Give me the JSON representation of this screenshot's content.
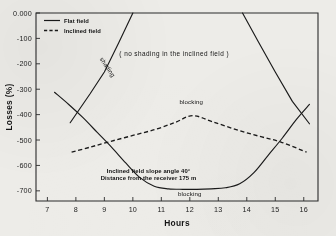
{
  "figure": {
    "background_color": "#edece8",
    "ink_color": "#1a1a1a"
  },
  "chart_data": {
    "type": "line",
    "title": "",
    "xlabel": "Hours",
    "ylabel": "Losses (%)",
    "xlim": [
      6.6,
      16.5
    ],
    "ylim": [
      -740,
      0
    ],
    "grid": false,
    "legend_position": "top-left",
    "xticks": [
      "7",
      "8",
      "9",
      "10",
      "11",
      "12",
      "13",
      "14",
      "15",
      "16"
    ],
    "xtick_values": [
      7,
      8,
      9,
      10,
      11,
      12,
      13,
      14,
      15,
      16
    ],
    "yticks": [
      "-700",
      "-600",
      "-500",
      "-400",
      "-300",
      "-200",
      "-100",
      "0.000"
    ],
    "ytick_values": [
      -700,
      -600,
      -500,
      -400,
      -300,
      -200,
      -100,
      0
    ],
    "series": [
      {
        "name": "Flat field",
        "style": "solid",
        "label": "blocking",
        "x": [
          7.25,
          7.75,
          8.25,
          8.75,
          9.25,
          9.75,
          10.25,
          10.75,
          11.25,
          11.75,
          12.25,
          12.75,
          13.25,
          13.75,
          14.25,
          14.75,
          15.25,
          15.75,
          16.2
        ],
        "values": [
          -312,
          -360,
          -412,
          -470,
          -528,
          -590,
          -648,
          -682,
          -692,
          -694,
          -694,
          -692,
          -688,
          -672,
          -628,
          -560,
          -492,
          -418,
          -360
        ]
      },
      {
        "name": "Flat field shading (morning)",
        "style": "solid",
        "label": "shading",
        "x": [
          7.8,
          8.5,
          9.0,
          9.5,
          10.0
        ],
        "values": [
          -432,
          -318,
          -232,
          -118,
          0
        ]
      },
      {
        "name": "Flat field shading (evening)",
        "style": "solid",
        "label": "",
        "x": [
          13.85,
          14.4,
          15.0,
          15.6,
          16.2
        ],
        "values": [
          0,
          -112,
          -232,
          -348,
          -436
        ]
      },
      {
        "name": "Inclined field",
        "style": "dashed",
        "label": "blocking",
        "x": [
          7.85,
          8.5,
          9.2,
          10.0,
          10.8,
          11.5,
          12.1,
          12.8,
          13.6,
          14.4,
          15.2,
          16.1
        ],
        "values": [
          -548,
          -528,
          -506,
          -482,
          -458,
          -430,
          -404,
          -428,
          -458,
          -484,
          -508,
          -548
        ]
      }
    ],
    "annotations": [
      {
        "id": "blocking-top",
        "text": "blocking",
        "x": 12.0,
        "y": -722
      },
      {
        "id": "blocking-middle",
        "text": "blocking",
        "x": 12.05,
        "y": -360
      },
      {
        "id": "shading-label",
        "text": "shading",
        "x": 9.05,
        "y": -218,
        "rotation": 56
      },
      {
        "id": "distance-note",
        "text": "Distance from the receiver 175 m",
        "x": 10.55,
        "y": -658
      },
      {
        "id": "slope-note",
        "text": "Inclined field slope angle 40°",
        "x": 10.55,
        "y": -630
      },
      {
        "id": "no-shading-note",
        "text": "( no shading in the inclined field )",
        "x": 11.45,
        "y": -168
      }
    ]
  },
  "legend": {
    "entries": [
      {
        "label": "Flat field",
        "style": "solid"
      },
      {
        "label": "Inclined field",
        "style": "dashed"
      }
    ]
  }
}
